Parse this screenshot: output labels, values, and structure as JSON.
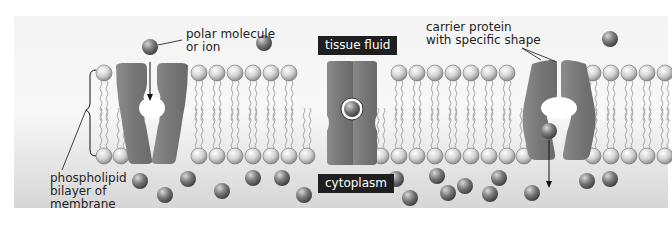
{
  "diagram": {
    "regions": {
      "top": "tissue fluid",
      "bottom": "cytoplasm"
    },
    "labels": {
      "polar_molecule": [
        "polar molecule",
        "or ion"
      ],
      "carrier_protein": [
        "carrier protein",
        "with specific shape"
      ],
      "bilayer": [
        "phospholipid",
        "bilayer of",
        "membrane"
      ]
    },
    "colors": {
      "background_top": "#f2f2f2",
      "background_bottom": "#d9d9d9",
      "protein": "#7a7a7a",
      "molecule": "#6a6a6a",
      "phospholipid_head": "#cfcfcf",
      "label_box": "#1f1f1f"
    }
  }
}
